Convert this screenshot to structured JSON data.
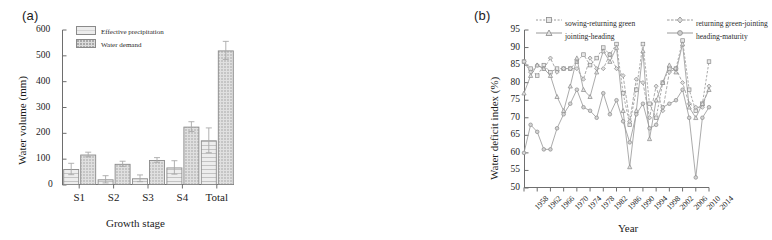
{
  "figure": {
    "panel_a_label": "(a)",
    "panel_b_label": "(b)"
  },
  "chart_data": [
    {
      "type": "bar",
      "panel": "(a)",
      "title": "",
      "xlabel": "Growth stage",
      "ylabel": "Water volume (mm)",
      "ylim": [
        0,
        600
      ],
      "yticks": [
        0,
        100,
        200,
        300,
        400,
        500,
        600
      ],
      "grid": false,
      "legend_position": "top-left",
      "categories": [
        "S1",
        "S2",
        "S3",
        "S4",
        "Total"
      ],
      "series": [
        {
          "name": "Effective precipitation",
          "values": [
            62,
            22,
            26,
            68,
            173
          ],
          "errors": [
            22,
            14,
            13,
            26,
            48
          ]
        },
        {
          "name": "Water demand",
          "values": [
            118,
            82,
            97,
            226,
            521
          ],
          "errors": [
            9,
            10,
            9,
            19,
            35
          ]
        }
      ]
    },
    {
      "type": "line",
      "panel": "(b)",
      "title": "",
      "xlabel": "Year",
      "ylabel": "Water deficit index (%)",
      "ylim": [
        50,
        95
      ],
      "yticks": [
        50,
        55,
        60,
        65,
        70,
        75,
        80,
        85,
        90,
        95
      ],
      "xticks": [
        1958,
        1962,
        1966,
        1970,
        1974,
        1978,
        1982,
        1986,
        1990,
        1994,
        1998,
        2002,
        2006,
        2010,
        2014
      ],
      "xlim": [
        1958,
        2014
      ],
      "grid": false,
      "legend_position": "top",
      "x": [
        1958,
        1960,
        1962,
        1964,
        1966,
        1968,
        1970,
        1972,
        1974,
        1976,
        1978,
        1980,
        1982,
        1984,
        1986,
        1988,
        1990,
        1992,
        1994,
        1996,
        1998,
        2000,
        2002,
        2004,
        2006,
        2008,
        2010,
        2012,
        2014
      ],
      "series": [
        {
          "name": "sowing-returning green",
          "values": [
            86,
            84,
            82,
            85,
            83,
            84,
            84,
            84,
            86,
            88,
            85,
            87,
            90,
            88,
            91,
            77,
            68,
            78,
            91,
            74,
            70,
            80,
            84,
            84,
            92,
            78,
            72,
            74,
            86
          ]
        },
        {
          "name": "returning green-jointing",
          "values": [
            86,
            83,
            85,
            84,
            87,
            83,
            84,
            84,
            84,
            81,
            87,
            84,
            84,
            88,
            84,
            82,
            69,
            81,
            80,
            70,
            79,
            72,
            83,
            84,
            80,
            74,
            73,
            73,
            79
          ]
        },
        {
          "name": "jointing-heading",
          "values": [
            77,
            82,
            85,
            84,
            82,
            76,
            72,
            79,
            87,
            78,
            76,
            83,
            89,
            86,
            90,
            72,
            56,
            72,
            89,
            64,
            75,
            80,
            85,
            83,
            91,
            73,
            70,
            74,
            78
          ]
        },
        {
          "name": "heading-maturity",
          "values": [
            60,
            68,
            66,
            61,
            61,
            67,
            71,
            74,
            78,
            73,
            72,
            70,
            77,
            71,
            75,
            69,
            63,
            71,
            74,
            67,
            68,
            73,
            74,
            75,
            78,
            70,
            53,
            70,
            73
          ]
        }
      ]
    }
  ]
}
